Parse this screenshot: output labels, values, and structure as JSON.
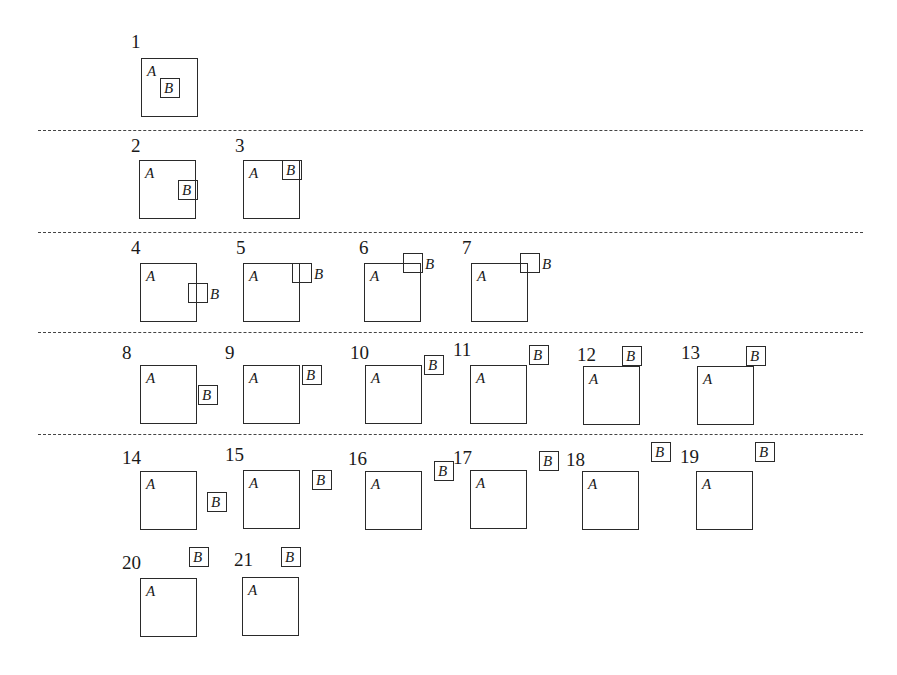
{
  "figure": {
    "separators": [
      {
        "y": 130,
        "x1": 38,
        "x2": 863
      },
      {
        "y": 232,
        "x1": 38,
        "x2": 863
      },
      {
        "y": 332,
        "x1": 38,
        "x2": 863
      },
      {
        "y": 434,
        "x1": 38,
        "x2": 863
      }
    ],
    "panels": [
      {
        "number": "1",
        "num_x": 131,
        "num_y": 32,
        "a_x": 141,
        "a_y": 58,
        "b_x": 160,
        "b_y": 78,
        "b_label_pos": "inside",
        "label_a": "A",
        "label_b": "B"
      },
      {
        "number": "2",
        "num_x": 131,
        "num_y": 136,
        "a_x": 139,
        "a_y": 160,
        "b_x": 178,
        "b_y": 180,
        "b_label_pos": "inside",
        "label_a": "A",
        "label_b": "B"
      },
      {
        "number": "3",
        "num_x": 235,
        "num_y": 136,
        "a_x": 243,
        "a_y": 160,
        "b_x": 282,
        "b_y": 160,
        "b_label_pos": "inside",
        "label_a": "A",
        "label_b": "B"
      },
      {
        "number": "4",
        "num_x": 131,
        "num_y": 238,
        "a_x": 140,
        "a_y": 263,
        "b_x": 188,
        "b_y": 283,
        "b_label_pos": "right",
        "label_a": "A",
        "label_b": "B"
      },
      {
        "number": "5",
        "num_x": 236,
        "num_y": 238,
        "a_x": 243,
        "a_y": 263,
        "b_x": 292,
        "b_y": 263,
        "b_label_pos": "right",
        "label_a": "A",
        "label_b": "B"
      },
      {
        "number": "6",
        "num_x": 359,
        "num_y": 238,
        "a_x": 364,
        "a_y": 263,
        "b_x": 403,
        "b_y": 253,
        "b_label_pos": "right",
        "label_a": "A",
        "label_b": "B"
      },
      {
        "number": "7",
        "num_x": 462,
        "num_y": 238,
        "a_x": 471,
        "a_y": 263,
        "b_x": 520,
        "b_y": 253,
        "b_label_pos": "right",
        "label_a": "A",
        "label_b": "B"
      },
      {
        "number": "8",
        "num_x": 122,
        "num_y": 343,
        "a_x": 140,
        "a_y": 365,
        "b_x": 198,
        "b_y": 385,
        "b_label_pos": "inside",
        "label_a": "A",
        "label_b": "B"
      },
      {
        "number": "9",
        "num_x": 225,
        "num_y": 343,
        "a_x": 243,
        "a_y": 365,
        "b_x": 302,
        "b_y": 365,
        "b_label_pos": "inside",
        "label_a": "A",
        "label_b": "B"
      },
      {
        "number": "10",
        "num_x": 350,
        "num_y": 343,
        "a_x": 365,
        "a_y": 365,
        "b_x": 424,
        "b_y": 355,
        "b_label_pos": "inside",
        "label_a": "A",
        "label_b": "B"
      },
      {
        "number": "11",
        "num_x": 453,
        "num_y": 340,
        "a_x": 470,
        "a_y": 365,
        "b_x": 529,
        "b_y": 345,
        "b_label_pos": "inside",
        "label_a": "A",
        "label_b": "B"
      },
      {
        "number": "12",
        "num_x": 577,
        "num_y": 345,
        "a_x": 583,
        "a_y": 366,
        "b_x": 622,
        "b_y": 346,
        "b_label_pos": "inside",
        "label_a": "A",
        "label_b": "B"
      },
      {
        "number": "13",
        "num_x": 681,
        "num_y": 343,
        "a_x": 697,
        "a_y": 366,
        "b_x": 746,
        "b_y": 346,
        "b_label_pos": "inside",
        "label_a": "A",
        "label_b": "B"
      },
      {
        "number": "14",
        "num_x": 122,
        "num_y": 448,
        "a_x": 140,
        "a_y": 471,
        "b_x": 207,
        "b_y": 492,
        "b_label_pos": "inside",
        "label_a": "A",
        "label_b": "B"
      },
      {
        "number": "15",
        "num_x": 225,
        "num_y": 445,
        "a_x": 243,
        "a_y": 470,
        "b_x": 312,
        "b_y": 470,
        "b_label_pos": "inside",
        "label_a": "A",
        "label_b": "B"
      },
      {
        "number": "16",
        "num_x": 348,
        "num_y": 449,
        "a_x": 365,
        "a_y": 471,
        "b_x": 434,
        "b_y": 461,
        "b_label_pos": "inside",
        "label_a": "A",
        "label_b": "B"
      },
      {
        "number": "17",
        "num_x": 453,
        "num_y": 448,
        "a_x": 470,
        "a_y": 470,
        "b_x": 539,
        "b_y": 451,
        "b_label_pos": "inside",
        "label_a": "A",
        "label_b": "B"
      },
      {
        "number": "18",
        "num_x": 566,
        "num_y": 450,
        "a_x": 582,
        "a_y": 471,
        "b_x": 651,
        "b_y": 442,
        "b_label_pos": "inside",
        "label_a": "A",
        "label_b": "B"
      },
      {
        "number": "19",
        "num_x": 680,
        "num_y": 447,
        "a_x": 696,
        "a_y": 471,
        "b_x": 755,
        "b_y": 442,
        "b_label_pos": "inside",
        "label_a": "A",
        "label_b": "B"
      },
      {
        "number": "20",
        "num_x": 122,
        "num_y": 553,
        "a_x": 140,
        "a_y": 578,
        "b_x": 189,
        "b_y": 547,
        "b_label_pos": "inside",
        "label_a": "A",
        "label_b": "B"
      },
      {
        "number": "21",
        "num_x": 234,
        "num_y": 550,
        "a_x": 242,
        "a_y": 577,
        "b_x": 281,
        "b_y": 547,
        "b_label_pos": "inside",
        "label_a": "A",
        "label_b": "B"
      }
    ]
  }
}
